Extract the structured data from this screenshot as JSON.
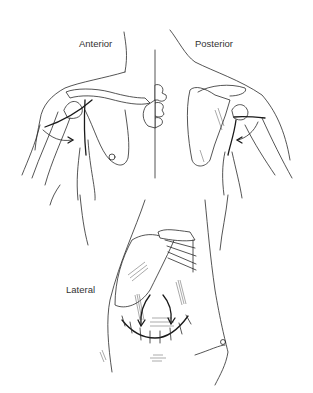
{
  "figure": {
    "labels": {
      "anterior": "Anterior",
      "posterior": "Posterior",
      "lateral": "Lateral"
    },
    "views": [
      "anterior",
      "posterior",
      "lateral"
    ],
    "colors": {
      "background": "#ffffff",
      "line": "#2a2a2a",
      "label": "#333333"
    }
  }
}
